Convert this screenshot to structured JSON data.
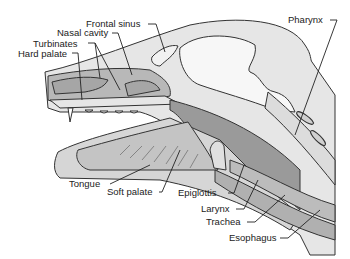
{
  "diagram": {
    "labels": [
      {
        "id": "frontal-sinus",
        "text": "Frontal sinus"
      },
      {
        "id": "nasal-cavity",
        "text": "Nasal cavity"
      },
      {
        "id": "turbinates",
        "text": "Turbinates"
      },
      {
        "id": "hard-palate",
        "text": "Hard palate"
      },
      {
        "id": "pharynx",
        "text": "Pharynx"
      },
      {
        "id": "tongue",
        "text": "Tongue"
      },
      {
        "id": "soft-palate",
        "text": "Soft palate"
      },
      {
        "id": "epiglottis",
        "text": "Epiglottis"
      },
      {
        "id": "larynx",
        "text": "Larynx"
      },
      {
        "id": "trachea",
        "text": "Trachea"
      },
      {
        "id": "esophagus",
        "text": "Esophagus"
      }
    ],
    "colors": {
      "light_gray": "#d9d9d9",
      "mid_gray": "#a8a8a8",
      "dark_gray": "#8a8a8a",
      "outline": "#333333",
      "background": "#ffffff"
    }
  }
}
